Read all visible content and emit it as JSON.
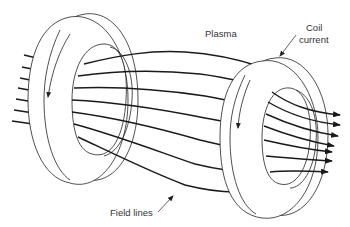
{
  "diagram": {
    "labels": {
      "plasma": "Plasma",
      "coil_current_line1": "Coil",
      "coil_current_line2": "current",
      "field_lines": "Field lines"
    },
    "elements": {
      "left_coil": "ring coil with downward current arrow",
      "right_coil": "ring coil with downward current arrow",
      "field_line_count": 7
    },
    "colors": {
      "stroke": "#1a1a1a",
      "background": "#ffffff",
      "text": "#333333"
    }
  }
}
